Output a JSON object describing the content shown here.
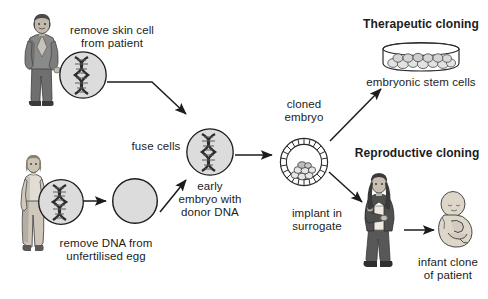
{
  "diagram": {
    "type": "process-flow",
    "background": "#ffffff",
    "ink": "#1c1c1c"
  },
  "labels": {
    "remove_skin_cell": "remove skin cell\nfrom patient",
    "fuse_cells": "fuse cells",
    "early_embryo": "early\nembryo with\ndonor DNA",
    "remove_dna": "remove DNA from\nunfertilised egg",
    "cloned_embryo": "cloned\nembryo",
    "therapeutic_cloning": "Therapeutic cloning",
    "embryonic_stem_cells": "embryonic stem cells",
    "reproductive_cloning": "Reproductive cloning",
    "implant_in_surrogate": "implant in\nsurrogate",
    "infant_clone": "infant clone\nof patient"
  },
  "figures": {
    "patient_man": "man-patient-figure",
    "donor_woman": "woman-egg-donor-figure",
    "surrogate_woman": "surrogate-mother-figure",
    "infant": "infant-clone-figure",
    "skin_cell": "skin-cell-with-dna",
    "egg_cell_with_dna": "unfertilised-egg-with-dna",
    "enucleated_egg": "enucleated-egg-cell",
    "fused_cell": "fused-cell-with-donor-dna",
    "blastocyst": "cloned-embryo-blastocyst",
    "petri_dish": "petri-dish-stem-cells"
  },
  "arrows": {
    "skin_to_fuse": "arrow-skin-cell-to-fused-cell",
    "egg_to_enucleated": "arrow-egg-to-enucleated",
    "enucleated_to_fuse": "arrow-enucleated-to-fused-cell",
    "fuse_to_embryo": "arrow-fused-cell-to-cloned-embryo",
    "embryo_to_dish": "arrow-embryo-to-petri-dish",
    "embryo_to_surrogate": "arrow-embryo-to-surrogate",
    "surrogate_to_infant": "arrow-surrogate-to-infant"
  },
  "colors": {
    "ink": "#1c1c1c",
    "cell_fill": "#d9d9d9",
    "cell_fill_light": "#e2e2e2",
    "figure_dark": "#4a4a4a",
    "figure_mid": "#7d7d7d",
    "figure_light": "#b5b5b5",
    "skin": "#c9c0b4"
  }
}
